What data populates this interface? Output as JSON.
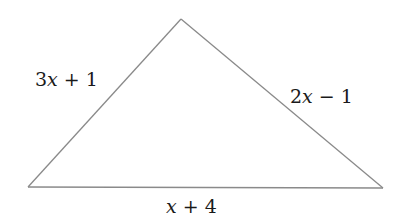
{
  "figure": {
    "shape": "triangle",
    "line_color": "#8a8a8a",
    "background": "#ffffff",
    "sides": [
      {
        "id": "left",
        "label_coef": "3",
        "label_var": "x",
        "label_rest": " + 1"
      },
      {
        "id": "right",
        "label_coef": "2",
        "label_var": "x",
        "label_rest": " − 1"
      },
      {
        "id": "bottom",
        "label_coef": "",
        "label_var": "x",
        "label_rest": " + 4"
      }
    ]
  }
}
